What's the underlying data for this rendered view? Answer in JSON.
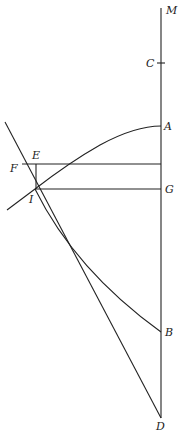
{
  "figure": {
    "type": "geometric-diagram",
    "stroke_color": "#222222",
    "background": "#ffffff",
    "points": {
      "M": {
        "label": "M",
        "x": 161,
        "y": 8
      },
      "C": {
        "label": "C",
        "x": 161,
        "y": 63
      },
      "A": {
        "label": "A",
        "x": 161,
        "y": 126
      },
      "E": {
        "label": "E",
        "x": 36,
        "y": 164
      },
      "F": {
        "label": "F",
        "x": 22,
        "y": 164
      },
      "G": {
        "label": "G",
        "x": 161,
        "y": 189
      },
      "I": {
        "label": "I",
        "x": 35,
        "y": 189
      },
      "B": {
        "label": "B",
        "x": 161,
        "y": 332
      },
      "D": {
        "label": "D",
        "x": 161,
        "y": 418
      }
    }
  }
}
